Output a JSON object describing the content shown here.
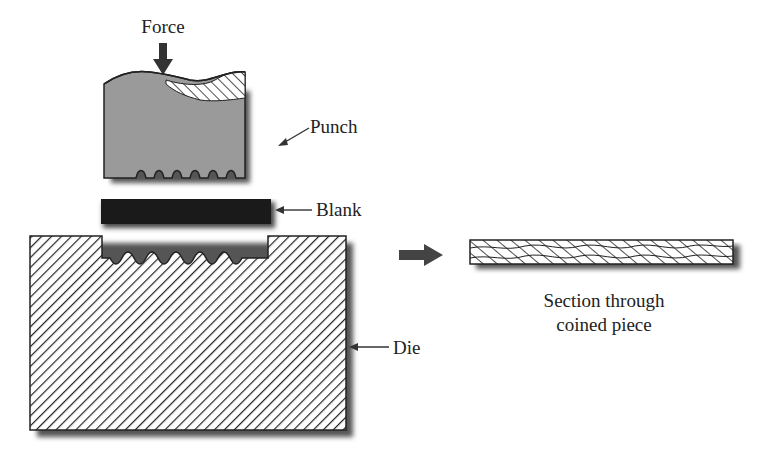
{
  "diagram": {
    "type": "process-diagram",
    "labels": {
      "force": "Force",
      "punch": "Punch",
      "blank": "Blank",
      "die": "Die",
      "section_line1": "Section through",
      "section_line2": "coined piece"
    },
    "components": [
      {
        "name": "Punch",
        "fill": "#9a9a9a",
        "pattern": "solid gray with hatched top relief"
      },
      {
        "name": "Blank",
        "fill": "#1a1a1a",
        "pattern": "solid black"
      },
      {
        "name": "Die",
        "fill": "#ffffff",
        "pattern": "diagonal hatch"
      },
      {
        "name": "Coined piece section",
        "fill": "#ffffff",
        "pattern": "diagonal hatch with wavy profile"
      }
    ],
    "colors": {
      "outline": "#222222",
      "punch": "#9a9a9a",
      "blank": "#1a1a1a",
      "shadow": "#555555",
      "arrow": "#3a3a3a"
    }
  }
}
